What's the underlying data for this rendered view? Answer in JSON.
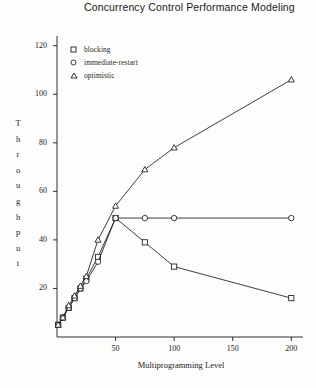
{
  "title": "Concurrency Control Performance Modeling",
  "axes": {
    "xlabel": "Multiprogramming Level",
    "ylabel": "Throughput",
    "ylabel_letters": [
      "T",
      "h",
      "r",
      "o",
      "u",
      "g",
      "h",
      "p",
      "u",
      "t"
    ],
    "xticks": [
      "50",
      "100",
      "150",
      "200"
    ],
    "yticks": [
      "20",
      "40",
      "60",
      "80",
      "100",
      "120"
    ]
  },
  "legend": [
    {
      "label": "blocking",
      "marker": "square"
    },
    {
      "label": "immediate-restart",
      "marker": "circle"
    },
    {
      "label": "optimistic",
      "marker": "triangle"
    }
  ],
  "chart_data": {
    "type": "line",
    "title": "Concurrency Control Performance Modeling",
    "xlabel": "Multiprogramming Level",
    "ylabel": "Throughput",
    "xlim": [
      0,
      210
    ],
    "ylim": [
      0,
      124
    ],
    "xticks": [
      50,
      100,
      150,
      200
    ],
    "yticks": [
      20,
      40,
      60,
      80,
      100,
      120
    ],
    "grid": false,
    "legend_position": "top-left",
    "series": [
      {
        "name": "blocking",
        "marker": "square",
        "x": [
          1,
          5,
          10,
          15,
          20,
          25,
          35,
          50,
          75,
          100,
          200
        ],
        "values": [
          5,
          8,
          12,
          16,
          20,
          24,
          33,
          49,
          39,
          29,
          16
        ]
      },
      {
        "name": "immediate-restart",
        "marker": "circle",
        "x": [
          1,
          5,
          10,
          15,
          20,
          25,
          35,
          50,
          75,
          100,
          200
        ],
        "values": [
          5,
          8,
          12,
          16,
          20,
          23,
          31,
          49,
          49,
          49,
          49
        ]
      },
      {
        "name": "optimistic",
        "marker": "triangle",
        "x": [
          1,
          5,
          10,
          15,
          20,
          25,
          35,
          50,
          75,
          100,
          200
        ],
        "values": [
          5,
          8,
          13,
          17,
          21,
          25,
          40,
          54,
          69,
          78,
          106
        ]
      }
    ]
  }
}
